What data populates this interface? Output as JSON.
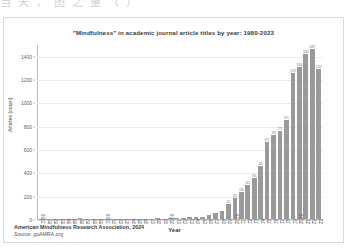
{
  "top_strip": {
    "clipped_text": "当 天    ， 图  之     量  （ ）"
  },
  "chart_data": {
    "type": "bar",
    "title": "\"Mindfulness\" in academic journal article titles by year: 1980-2023",
    "xlabel": "Year",
    "ylabel": "Articles (count)",
    "ylim": [
      0,
      1500
    ],
    "yticks": [
      0,
      200,
      400,
      600,
      800,
      1000,
      1200,
      1400
    ],
    "grid": true,
    "legend": null,
    "bar_color": "#9a9a9a",
    "categories": [
      "1980",
      "81",
      "82",
      "83",
      "84",
      "85",
      "86",
      "87",
      "88",
      "89",
      "1990",
      "91",
      "92",
      "93",
      "94",
      "95",
      "96",
      "97",
      "98",
      "99",
      "2000",
      "01",
      "02",
      "03",
      "04",
      "05",
      "06",
      "07",
      "08",
      "09",
      "2010",
      "11",
      "12",
      "13",
      "14",
      "15",
      "16",
      "17",
      "18",
      "19",
      "2020",
      "21",
      "22",
      "23"
    ],
    "values": [
      2,
      1,
      2,
      1,
      1,
      3,
      5,
      2,
      1,
      2,
      2,
      1,
      2,
      3,
      3,
      4,
      3,
      2,
      5,
      4,
      8,
      10,
      12,
      17,
      21,
      22,
      39,
      52,
      70,
      131,
      181,
      236,
      302,
      356,
      462,
      674,
      740,
      771,
      871,
      1279,
      1334,
      1448,
      1487,
      1314
    ],
    "labeled_points": {
      "2009": 131,
      "2010": 181,
      "2011": 236,
      "2012": 302,
      "2013": 356,
      "2014": 462,
      "2015": 674,
      "2016": 740,
      "2017": 771,
      "2018": 871,
      "2019": 1279,
      "2020": 1334,
      "2021": 1448,
      "2022": 1487,
      "2023": 1314
    }
  },
  "footer": {
    "line1": "American Mindfulness Research Association, 2024",
    "line2": "Source: goAMRA.org"
  }
}
